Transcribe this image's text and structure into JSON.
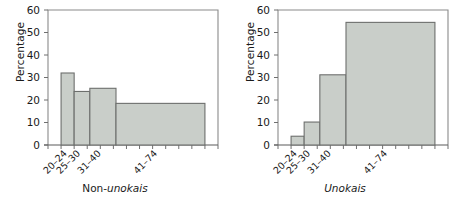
{
  "figure": {
    "background": "#ffffff",
    "bar_fill": "#c9cec9",
    "bar_stroke": "#6d6f6d",
    "frame_color": "#8a8a8a"
  },
  "chart_data": [
    {
      "type": "bar",
      "title": "",
      "panel_label": "Non-unokais",
      "panel_label_plain": "Non-",
      "panel_label_italic": "unokais",
      "xlabel": "",
      "ylabel": "Percentage",
      "categories": [
        "20–24",
        "25–30",
        "31–40",
        "41–74"
      ],
      "values": [
        32,
        23.8,
        25.2,
        18.5
      ],
      "bin_edges": [
        20,
        25,
        31,
        41,
        75
      ],
      "ylim": [
        0,
        60
      ],
      "yticks": [
        0,
        10,
        20,
        30,
        40,
        50,
        60
      ],
      "ytick_labels": [
        "0",
        "10",
        "20",
        "30",
        "40",
        "50",
        "60"
      ],
      "xlim": [
        15,
        80
      ],
      "xticks": [
        15,
        20,
        25,
        30,
        35,
        40,
        45,
        50,
        55,
        60,
        65,
        70,
        75,
        80
      ],
      "grid": false,
      "legend": false
    },
    {
      "type": "bar",
      "title": "",
      "panel_label": "Unokais",
      "panel_label_plain": "",
      "panel_label_italic": "Unokais",
      "xlabel": "",
      "ylabel": "Percentage",
      "categories": [
        "20–24",
        "25–30",
        "31–40",
        "41–74"
      ],
      "values": [
        3.9,
        10.2,
        31.2,
        54.5
      ],
      "bin_edges": [
        20,
        25,
        31,
        41,
        75
      ],
      "ylim": [
        0,
        60
      ],
      "yticks": [
        0,
        10,
        20,
        30,
        40,
        50,
        60
      ],
      "ytick_labels": [
        "0",
        "10",
        "20",
        "30",
        "40",
        "50",
        "60"
      ],
      "xlim": [
        15,
        80
      ],
      "xticks": [
        15,
        20,
        25,
        30,
        35,
        40,
        45,
        50,
        55,
        60,
        65,
        70,
        75,
        80
      ],
      "grid": false,
      "legend": false
    }
  ]
}
